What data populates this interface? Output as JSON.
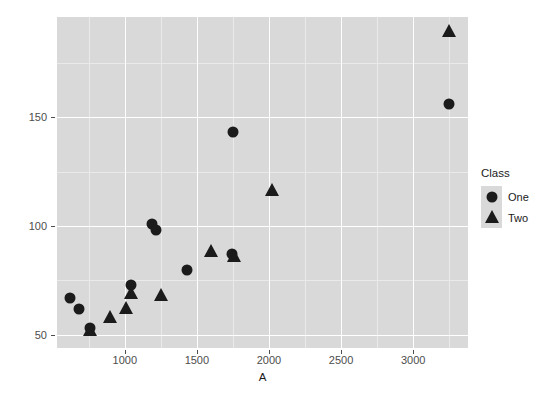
{
  "chart_data": {
    "type": "scatter",
    "title": "",
    "xlabel": "A",
    "ylabel": "B",
    "xlim": [
      530,
      3380
    ],
    "ylim": [
      44,
      196
    ],
    "xticks": [
      1000,
      1500,
      2000,
      2500,
      3000
    ],
    "yticks": [
      50,
      100,
      150
    ],
    "xtick_labels": [
      "1000",
      "1500",
      "2000",
      "2500",
      "3000"
    ],
    "ytick_labels": [
      "50",
      "100",
      "150"
    ],
    "grid": true,
    "legend": {
      "title": "Class",
      "position": "right",
      "entries": [
        {
          "label": "One",
          "marker": "circle"
        },
        {
          "label": "Two",
          "marker": "triangle"
        }
      ]
    },
    "series": [
      {
        "name": "One",
        "marker": "circle",
        "points": [
          {
            "x": 620,
            "y": 67
          },
          {
            "x": 680,
            "y": 62
          },
          {
            "x": 760,
            "y": 53
          },
          {
            "x": 1040,
            "y": 73
          },
          {
            "x": 1190,
            "y": 101
          },
          {
            "x": 1215,
            "y": 98
          },
          {
            "x": 1430,
            "y": 80
          },
          {
            "x": 1745,
            "y": 87
          },
          {
            "x": 1750,
            "y": 143
          },
          {
            "x": 3250,
            "y": 156
          }
        ]
      },
      {
        "name": "Two",
        "marker": "triangle",
        "points": [
          {
            "x": 760,
            "y": 52
          },
          {
            "x": 900,
            "y": 58
          },
          {
            "x": 1010,
            "y": 62
          },
          {
            "x": 1045,
            "y": 69
          },
          {
            "x": 1250,
            "y": 68
          },
          {
            "x": 1600,
            "y": 88
          },
          {
            "x": 1760,
            "y": 86
          },
          {
            "x": 2020,
            "y": 116
          },
          {
            "x": 3250,
            "y": 189
          }
        ]
      }
    ],
    "colors": {
      "marker": "#1b1b1b",
      "panel_background": "#d9d9d9",
      "grid_major": "#ffffff",
      "grid_minor": "#eaeaea",
      "axis_text": "#4d4d4d",
      "title_text": "#1a1a1a",
      "page_background": "#ffffff"
    }
  }
}
